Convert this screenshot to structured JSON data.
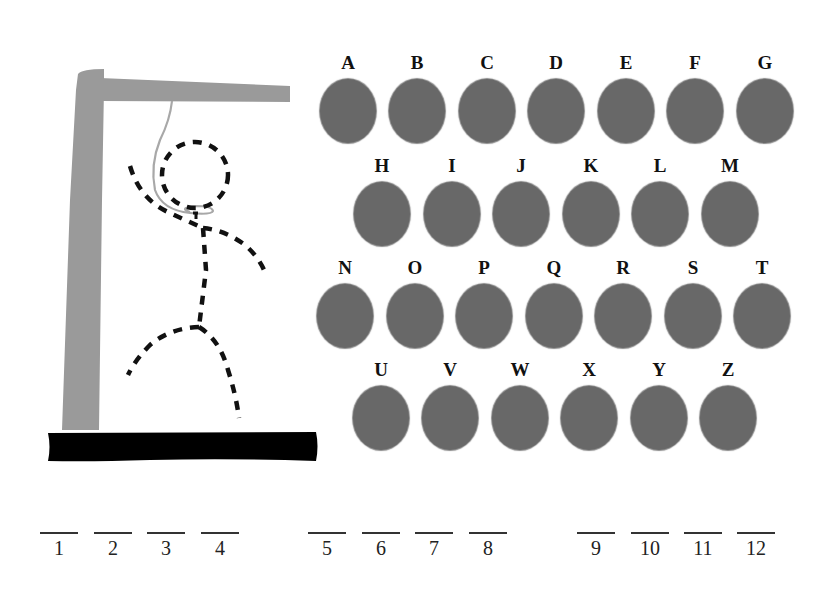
{
  "game": {
    "type": "hangman",
    "colors": {
      "gallows_post": "#9a9a9a",
      "gallows_base": "#000000",
      "rope": "#a8a8a8",
      "figure_dashes": "#111111",
      "letter_disc": "#686868"
    }
  },
  "keyboard": {
    "rows": [
      {
        "letters": [
          "A",
          "B",
          "C",
          "D",
          "E",
          "F",
          "G"
        ]
      },
      {
        "letters": [
          "H",
          "I",
          "J",
          "K",
          "L",
          "M"
        ]
      },
      {
        "letters": [
          "N",
          "O",
          "P",
          "Q",
          "R",
          "S",
          "T"
        ]
      },
      {
        "letters": [
          "U",
          "V",
          "W",
          "X",
          "Y",
          "Z"
        ]
      }
    ]
  },
  "word_slots": {
    "groups": [
      {
        "slots": [
          "1",
          "2",
          "3",
          "4"
        ]
      },
      {
        "slots": [
          "5",
          "6",
          "7",
          "8"
        ]
      },
      {
        "slots": [
          "9",
          "10",
          "11",
          "12"
        ]
      }
    ]
  }
}
